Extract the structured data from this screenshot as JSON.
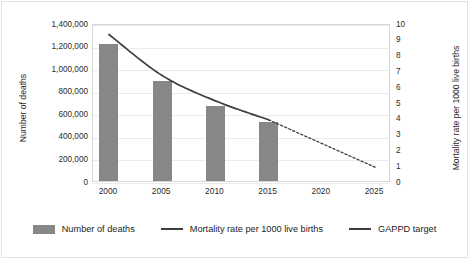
{
  "chart_data": {
    "type": "bar",
    "title": "",
    "subtitle": "",
    "xlabel": "",
    "ylabel": "Number of deaths",
    "y2label": "Mortality rate per 1000 live births",
    "categories": [
      "2000",
      "2005",
      "2010",
      "2015",
      "2020",
      "2025"
    ],
    "x": [
      2000,
      2005,
      2010,
      2015,
      2020,
      2025
    ],
    "xlim": [
      1998.5,
      2026.5
    ],
    "ylim": [
      0,
      1400000
    ],
    "y2lim": [
      0,
      10
    ],
    "grid": true,
    "legend_position": "bottom",
    "y_ticks": [
      "0",
      "200,000",
      "400,000",
      "600,000",
      "800,000",
      "1,000,000",
      "1,200,000",
      "1,400,000"
    ],
    "y_tick_values": [
      0,
      200000,
      400000,
      600000,
      800000,
      1000000,
      1200000,
      1400000
    ],
    "y2_ticks": [
      "0",
      "1",
      "2",
      "3",
      "4",
      "5",
      "6",
      "7",
      "8",
      "9",
      "10"
    ],
    "y2_tick_values": [
      0,
      1,
      2,
      3,
      4,
      5,
      6,
      7,
      8,
      9,
      10
    ],
    "series": [
      {
        "name": "Number of deaths",
        "type": "bar",
        "axis": "left",
        "color": "#878787",
        "x": [
          2000,
          2005,
          2010,
          2015
        ],
        "values": [
          1215000,
          885000,
          665000,
          520000
        ]
      },
      {
        "name": "Mortality rate per 1000 live births",
        "type": "line",
        "axis": "right",
        "color": "#3d3d3d",
        "style": "solid",
        "x": [
          2000,
          2005,
          2010,
          2015
        ],
        "values": [
          9.4,
          6.8,
          5.2,
          4.0
        ]
      },
      {
        "name": "GAPPD target",
        "type": "line",
        "axis": "right",
        "color": "#3d3d3d",
        "style": "dashed",
        "x": [
          2015,
          2025
        ],
        "values": [
          4.0,
          1.0
        ]
      }
    ],
    "legend": [
      {
        "label": "Number of deaths",
        "marker": "bar",
        "color": "#878787"
      },
      {
        "label": "Mortality rate per 1000 live births",
        "marker": "line",
        "color": "#3d3d3d"
      },
      {
        "label": "GAPPD target",
        "marker": "line",
        "color": "#3d3d3d"
      }
    ],
    "colors": {
      "bar": "#878787",
      "line": "#3d3d3d",
      "grid": "#ebebeb",
      "axis": "#d6d6d6",
      "text": "#2b2b2b",
      "background": "#ffffff"
    }
  }
}
